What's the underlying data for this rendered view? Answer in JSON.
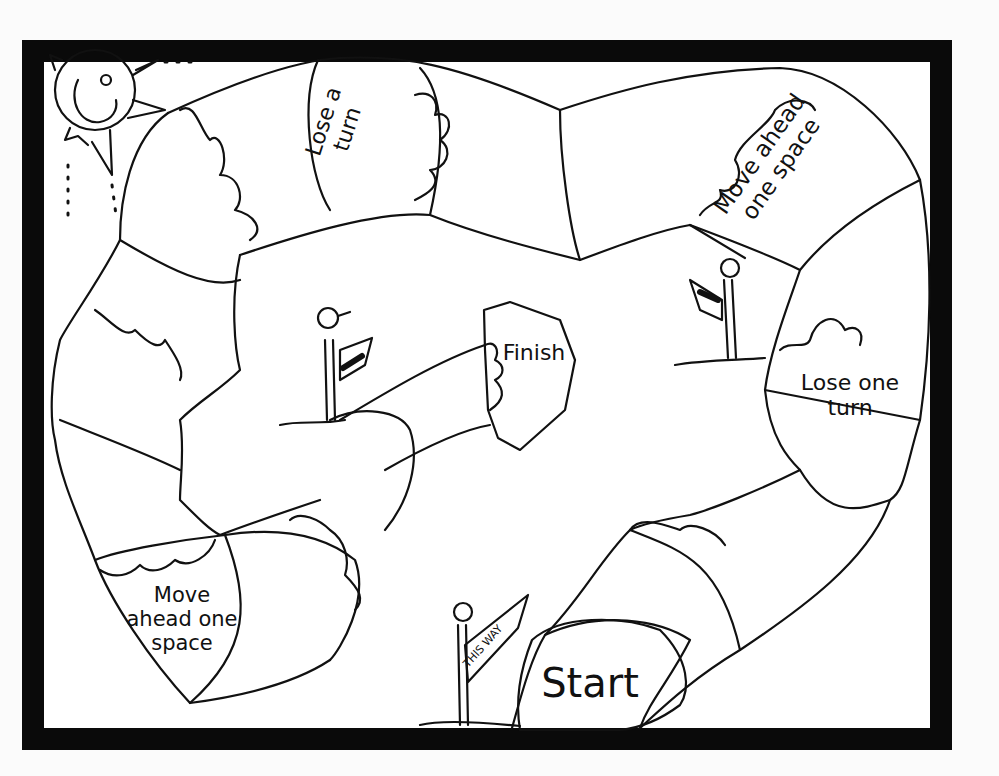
{
  "board": {
    "border_color": "#0a0a0a",
    "background": "#ffffff",
    "spaces": {
      "lose_a_turn": {
        "line1": "Lose a",
        "line2": "turn"
      },
      "move_ahead_top": {
        "line1": "Move ahead",
        "line2": "one space"
      },
      "lose_one_turn": {
        "line1": "Lose one",
        "line2": "turn"
      },
      "move_ahead_bottom": {
        "line1": "Move",
        "line2": "ahead one",
        "line3": "space"
      },
      "start": "Start",
      "finish": "Finish"
    },
    "sign_text": "THIS WAY"
  }
}
